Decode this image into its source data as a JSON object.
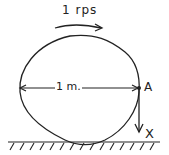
{
  "diagram": {
    "rotation_label": "1 rps",
    "diameter_label": "1 m.",
    "point_label": "A",
    "velocity_label": "X",
    "colors": {
      "ink": "#222222",
      "background": "#ffffff"
    }
  }
}
